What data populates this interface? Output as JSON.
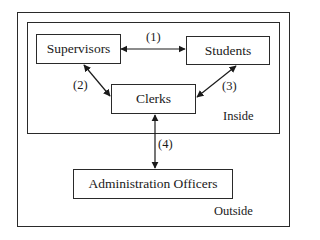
{
  "diagram": {
    "regions": {
      "outside": {
        "label": "Outside"
      },
      "inside": {
        "label": "Inside"
      }
    },
    "nodes": {
      "supervisors": {
        "label": "Supervisors"
      },
      "students": {
        "label": "Students"
      },
      "clerks": {
        "label": "Clerks"
      },
      "admin": {
        "label": "Administration Officers"
      }
    },
    "edges": [
      {
        "id": "1",
        "label": "(1)",
        "from": "Supervisors",
        "to": "Students",
        "direction": "bidirectional"
      },
      {
        "id": "2",
        "label": "(2)",
        "from": "Supervisors",
        "to": "Clerks",
        "direction": "bidirectional"
      },
      {
        "id": "3",
        "label": "(3)",
        "from": "Students",
        "to": "Clerks",
        "direction": "bidirectional"
      },
      {
        "id": "4",
        "label": "(4)",
        "from": "Clerks",
        "to": "Administration Officers",
        "direction": "bidirectional"
      }
    ]
  }
}
